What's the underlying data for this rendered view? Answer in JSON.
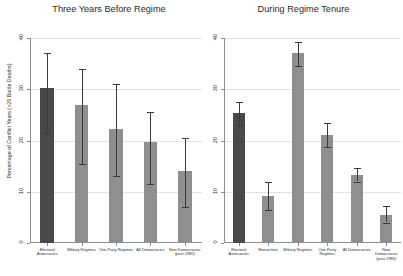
{
  "figure": {
    "ylabel": "Percentage of Conflict Years (>25 Battle Deaths)",
    "bar_color": "#8f8f8f",
    "highlight_bar_color": "#494949",
    "error_color": "#3a3a3a",
    "grid_color": "#e2e2e2",
    "axis_color": "#8d8d8d"
  },
  "chart_data": [
    {
      "type": "bar",
      "title": "Three Years Before Regime",
      "xlabel": "",
      "ylabel": "Percentage of Conflict Years (>25 Battle Deaths)",
      "ylim": [
        0,
        40
      ],
      "yticks": [
        0,
        10,
        20,
        30,
        40
      ],
      "ytick_labels": [
        "0",
        "10",
        "20",
        "30",
        "40"
      ],
      "grid": true,
      "legend": "none",
      "categories": [
        "Electoral Autocracies",
        "Military Regimes",
        "One-Party Regimes",
        "All Democracies",
        "New Democracies (post-1990)"
      ],
      "values": [
        30.3,
        27.0,
        22.3,
        19.7,
        14.0
      ],
      "error_low": [
        21.5,
        15.5,
        13.0,
        11.5,
        7.0
      ],
      "error_high": [
        37.0,
        34.0,
        31.0,
        25.5,
        20.5
      ],
      "highlight_index": 0
    },
    {
      "type": "bar",
      "title": "During Regime Tenure",
      "xlabel": "",
      "ylabel": "",
      "ylim": [
        0,
        40
      ],
      "yticks": [
        0,
        10,
        20,
        30,
        40
      ],
      "ytick_labels": [
        "0",
        "10",
        "20",
        "30",
        "40"
      ],
      "grid": true,
      "legend": "none",
      "categories": [
        "Electoral Autocracies",
        "Monarchies",
        "Military Regimes",
        "One-Party Regimes",
        "All Democracies",
        "New Democracies (post-1990)"
      ],
      "values": [
        25.3,
        9.2,
        37.0,
        21.0,
        13.3,
        5.5
      ],
      "error_low": [
        23.0,
        6.5,
        34.5,
        18.8,
        12.0,
        4.0
      ],
      "error_high": [
        27.6,
        12.0,
        39.3,
        23.4,
        14.7,
        7.3
      ],
      "highlight_index": 0
    }
  ]
}
